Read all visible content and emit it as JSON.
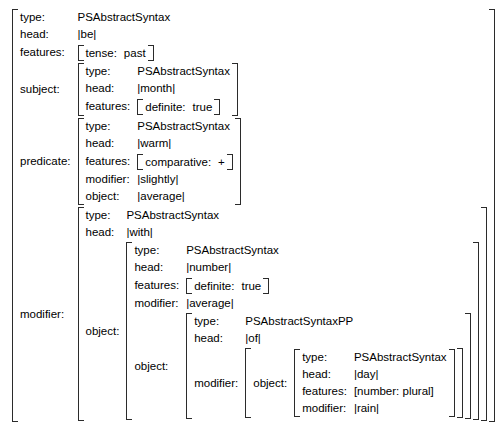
{
  "diagram": {
    "kind": "attribute-value-matrix",
    "notation": {
      "open_bracket": "[",
      "close_bracket": "]",
      "pipe": "|"
    },
    "attributes": {
      "type": "type:",
      "head": "head:",
      "features": "features:",
      "subject": "subject:",
      "predicate": "predicate:",
      "modifier": "modifier:",
      "object": "object:"
    },
    "types": {
      "abstract_syntax": "PSAbstractSyntax",
      "abstract_syntax_pp": "PSAbstractSyntaxPP"
    },
    "root": {
      "type": "PSAbstractSyntax",
      "head": "|be|",
      "features": {
        "attr": "tense:",
        "value": "past"
      },
      "subject": {
        "type": "PSAbstractSyntax",
        "head": "|month|",
        "features": {
          "attr": "definite:",
          "value": "true"
        }
      },
      "predicate": {
        "type": "PSAbstractSyntax",
        "head": "|warm|",
        "features": {
          "attr": "comparative:",
          "value": "+"
        },
        "modifier": "|slightly|",
        "object": "|average|"
      },
      "modifier": {
        "type": "PSAbstractSyntax",
        "head": "|with|",
        "object": {
          "type": "PSAbstractSyntax",
          "head": "|number|",
          "features": {
            "attr": "definite:",
            "value": "true"
          },
          "modifier": "|average|",
          "object": {
            "type": "PSAbstractSyntaxPP",
            "head": "|of|",
            "modifier": {
              "object": {
                "type": "PSAbstractSyntax",
                "head": "|day|",
                "features_literal": "[number: plural]",
                "modifier": "|rain|"
              }
            }
          }
        }
      }
    }
  }
}
